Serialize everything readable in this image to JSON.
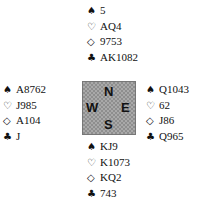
{
  "suit_symbols": {
    "spades": "♠",
    "hearts": "♡",
    "diamonds": "◇",
    "clubs": "♣"
  },
  "hands": {
    "north": {
      "spades": "5",
      "hearts": "AQ4",
      "diamonds": "9753",
      "clubs": "AK1082"
    },
    "west": {
      "spades": "A8762",
      "hearts": "J985",
      "diamonds": "A104",
      "clubs": "J"
    },
    "east": {
      "spades": "Q1043",
      "hearts": "62",
      "diamonds": "J86",
      "clubs": "Q965"
    },
    "south": {
      "spades": "KJ9",
      "hearts": "K1073",
      "diamonds": "KQ2",
      "clubs": "743"
    }
  },
  "compass": {
    "n": "N",
    "s": "S",
    "w": "W",
    "e": "E"
  }
}
